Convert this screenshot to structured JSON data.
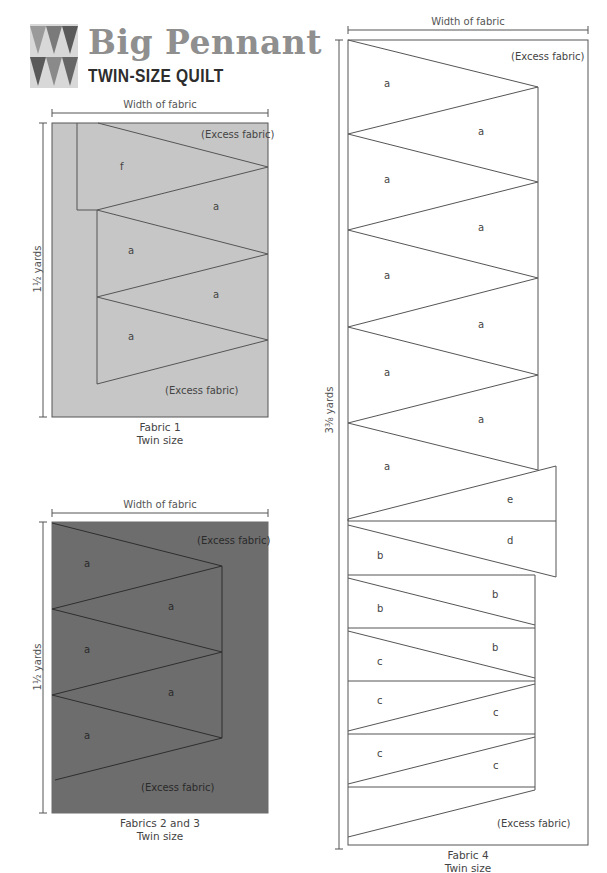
{
  "header": {
    "title": "Big Pennant",
    "subtitle": "TWIN-SIZE QUILT",
    "logo_colors": {
      "background": "#d8d8d8",
      "triangle_light": "#9a9a9a",
      "triangle_mid": "#7a7a7a",
      "triangle_dark": "#5a5a5a"
    }
  },
  "colors": {
    "fabric1": "#c6c6c6",
    "fabric23": "#6d6d6d",
    "fabric4": "#ffffff",
    "line": "#555555"
  },
  "diagrams": {
    "fabric1": {
      "width_label": "Width of fabric",
      "length_label": "1½ yards",
      "caption_line1": "Fabric 1",
      "caption_line2": "Twin size",
      "excess_top": "(Excess fabric)",
      "excess_bottom": "(Excess fabric)",
      "pieces": [
        "f",
        "a",
        "a",
        "a",
        "a"
      ]
    },
    "fabric23": {
      "width_label": "Width of fabric",
      "length_label": "1½ yards",
      "caption_line1": "Fabrics 2 and 3",
      "caption_line2": "Twin size",
      "excess_top": "(Excess fabric)",
      "excess_bottom": "(Excess fabric)",
      "pieces": [
        "a",
        "a",
        "a",
        "a",
        "a"
      ]
    },
    "fabric4": {
      "width_label": "Width of fabric",
      "length_label": "3⅜ yards",
      "caption_line1": "Fabric 4",
      "caption_line2": "Twin size",
      "excess_top": "(Excess fabric)",
      "excess_bottom": "(Excess fabric)",
      "pieces": [
        "a",
        "a",
        "a",
        "a",
        "a",
        "a",
        "a",
        "a",
        "a",
        "e",
        "d",
        "b",
        "b",
        "b",
        "b",
        "c",
        "c",
        "c",
        "c",
        "c"
      ]
    }
  }
}
